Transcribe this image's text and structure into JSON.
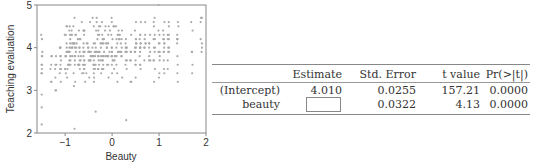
{
  "chart_data": {
    "type": "scatter",
    "title": "",
    "xlabel": "Beauty",
    "ylabel": "Teaching evaluation",
    "xlim": [
      -1.6,
      2.0
    ],
    "ylim": [
      2.0,
      5.0
    ],
    "xticks": [
      "-1",
      "0",
      "1",
      "2"
    ],
    "yticks": [
      "2",
      "3",
      "4",
      "5"
    ],
    "grid": false,
    "point_color": "#aaaaaa",
    "points_note": "approx. 463 points; dense cloud between x -1.2..1 and y 3..5, slight positive trend"
  },
  "table": {
    "headers": [
      "",
      "Estimate",
      "Std. Error",
      "t value",
      "Pr(>|t|)"
    ],
    "rows": [
      {
        "label": "(Intercept)",
        "estimate": "4.010",
        "std_error": "0.0255",
        "t_value": "157.21",
        "p_value": "0.0000"
      },
      {
        "label": "beauty",
        "estimate": "",
        "std_error": "0.0322",
        "t_value": "4.13",
        "p_value": "0.0000"
      }
    ]
  }
}
